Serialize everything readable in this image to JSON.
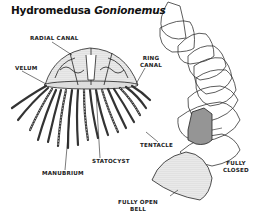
{
  "title": {
    "prefix": "Hydromedusa ",
    "genus": "Gonionemus"
  },
  "labels": {
    "radial_canal": "RADIAL CANAL",
    "velum": "VELUM",
    "ring_canal_1": "RING",
    "ring_canal_2": "CANAL",
    "tentacle": "TENTACLE",
    "statocyst": "STATOCYST",
    "manubrium": "MANUBRIUM",
    "fully_closed_1": "FULLY",
    "fully_closed_2": "CLOSED",
    "fully_open_1": "FULLY OPEN",
    "fully_open_2": "BELL"
  },
  "colors": {
    "ink": "#222222",
    "stipple": "#bdbdbd",
    "background": "#ffffff"
  }
}
